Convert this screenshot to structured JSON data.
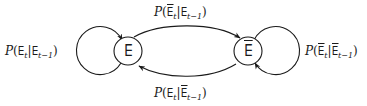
{
  "diagram": {
    "type": "state-transition",
    "colors": {
      "stroke": "#1a1a1a",
      "background": "#ffffff"
    },
    "nodes": [
      {
        "id": "exists",
        "symbol": "∃",
        "negated": false
      },
      {
        "id": "not_exists",
        "symbol": "∃",
        "negated": true
      }
    ],
    "edges": [
      {
        "from": "exists",
        "to": "exists",
        "label": {
          "prefix": "P(",
          "a": "∃",
          "a_bar": false,
          "a_sub": "t",
          "sep": "|",
          "b": "∃",
          "b_bar": false,
          "b_sub": "t−1",
          "suffix": ")"
        }
      },
      {
        "from": "exists",
        "to": "not_exists",
        "label": {
          "prefix": "P(",
          "a": "∃",
          "a_bar": true,
          "a_sub": "t",
          "sep": "|",
          "b": "∃",
          "b_bar": false,
          "b_sub": "t−1",
          "suffix": ")"
        }
      },
      {
        "from": "not_exists",
        "to": "not_exists",
        "label": {
          "prefix": "P(",
          "a": "∃",
          "a_bar": true,
          "a_sub": "t",
          "sep": "|",
          "b": "∃",
          "b_bar": true,
          "b_sub": "t−1",
          "suffix": ")"
        }
      },
      {
        "from": "not_exists",
        "to": "exists",
        "label": {
          "prefix": "P(",
          "a": "∃",
          "a_bar": false,
          "a_sub": "t",
          "sep": "|",
          "b": "∃",
          "b_bar": true,
          "b_sub": "t−1",
          "suffix": ")"
        }
      }
    ]
  }
}
